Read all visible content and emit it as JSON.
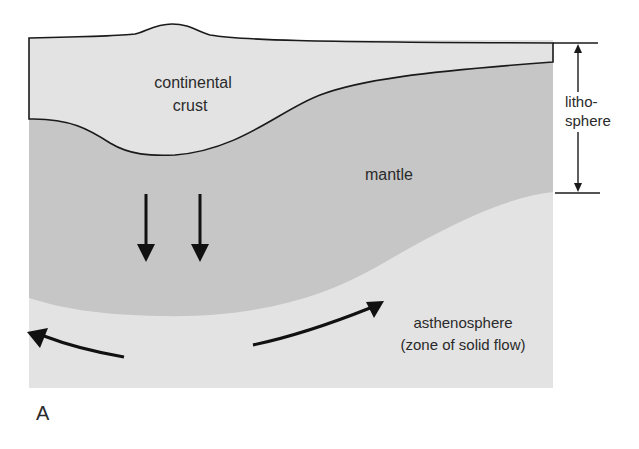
{
  "figure": {
    "panel_label": "A",
    "labels": {
      "crust_line1": "continental",
      "crust_line2": "crust",
      "mantle": "mantle",
      "litho_line1": "litho-",
      "litho_line2": "sphere",
      "astheno_line1": "asthenosphere",
      "astheno_line2": "(zone of solid flow)"
    },
    "colors": {
      "crust": "#e3e3e3",
      "mantle": "#c6c6c6",
      "asthenosphere": "#e3e3e3",
      "lines": "#1a1a1a",
      "text": "#2a2a2a"
    }
  }
}
